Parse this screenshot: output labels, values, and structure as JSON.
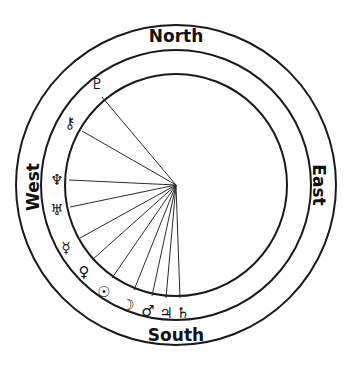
{
  "diagram": {
    "type": "astrological-chart-wheel",
    "center": {
      "x": 176,
      "y": 185
    },
    "radii": {
      "inner": 111,
      "middle": 135,
      "outer": 160
    },
    "directions": {
      "north": "North",
      "south": "South",
      "east": "East",
      "west": "West"
    },
    "planets": [
      {
        "name": "Pluto",
        "glyph": "♇",
        "end": {
          "x": 102,
          "y": 97
        },
        "label": {
          "x": 97,
          "y": 84
        }
      },
      {
        "name": "Chiron",
        "glyph": "⚷",
        "end": {
          "x": 82,
          "y": 131
        },
        "label": {
          "x": 70,
          "y": 123
        }
      },
      {
        "name": "Neptune",
        "glyph": "♆",
        "end": {
          "x": 69,
          "y": 180
        },
        "label": {
          "x": 57,
          "y": 180
        }
      },
      {
        "name": "Uranus",
        "glyph": "♅",
        "end": {
          "x": 70,
          "y": 207
        },
        "label": {
          "x": 57,
          "y": 210
        }
      },
      {
        "name": "Mercury",
        "glyph": "☿",
        "end": {
          "x": 80,
          "y": 238
        },
        "label": {
          "x": 66,
          "y": 248
        }
      },
      {
        "name": "Venus",
        "glyph": "♀",
        "end": {
          "x": 92,
          "y": 260
        },
        "label": {
          "x": 84,
          "y": 272
        }
      },
      {
        "name": "Sun",
        "glyph": "☉",
        "end": {
          "x": 112,
          "y": 278
        },
        "label": {
          "x": 104,
          "y": 292
        }
      },
      {
        "name": "Moon",
        "glyph": "☽",
        "end": {
          "x": 134,
          "y": 290
        },
        "label": {
          "x": 128,
          "y": 305
        }
      },
      {
        "name": "Mars",
        "glyph": "♂",
        "end": {
          "x": 152,
          "y": 296
        },
        "label": {
          "x": 148,
          "y": 311
        }
      },
      {
        "name": "Jupiter",
        "glyph": "♃",
        "end": {
          "x": 166,
          "y": 298
        },
        "label": {
          "x": 166,
          "y": 313
        }
      },
      {
        "name": "Saturn",
        "glyph": "♄",
        "end": {
          "x": 180,
          "y": 298
        },
        "label": {
          "x": 183,
          "y": 313
        }
      }
    ],
    "colors": {
      "line": "#1a1a1a",
      "background": "#ffffff"
    }
  }
}
